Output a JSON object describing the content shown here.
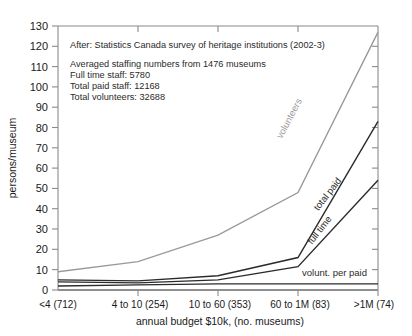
{
  "chart_data": {
    "type": "line",
    "title": "",
    "xlabel": "annual budget $10k, (no. museums)",
    "ylabel": "persons/museum",
    "categories": [
      "<4 (712)",
      "4 to 10 (254)",
      "10 to 60 (353)",
      "60 to 1M (83)",
      ">1M (74)"
    ],
    "ylim": [
      0,
      130
    ],
    "yticks": [
      0,
      10,
      20,
      30,
      40,
      50,
      60,
      70,
      80,
      90,
      100,
      110,
      120,
      130
    ],
    "grid": false,
    "legend": "inline-labels",
    "series": [
      {
        "name": "volunteers",
        "color": "#9a9a9a",
        "values": [
          9,
          14,
          27,
          48,
          127
        ]
      },
      {
        "name": "total paid",
        "color": "#2b2b2b",
        "values": [
          5,
          4.5,
          7,
          16,
          83
        ]
      },
      {
        "name": "full time",
        "color": "#2b2b2b",
        "values": [
          4,
          3.5,
          5,
          11.5,
          54
        ]
      },
      {
        "name": "volunt. per paid",
        "color": "#2b2b2b",
        "values": [
          2,
          2.5,
          3,
          3,
          3
        ]
      }
    ]
  },
  "annotations": {
    "source_line": "After: Statistics Canada survey of heritage institutions (2002-3)",
    "summary_lines": [
      "Averaged staffing numbers from 1476 museums",
      "Full time staff: 5780",
      "Total paid staff: 12168",
      "Total volunteers: 32688"
    ]
  },
  "axes": {
    "y_label": "persons/museum",
    "x_label": "annual budget $10k, (no. museums)",
    "y_tick_labels": [
      "0",
      "10",
      "20",
      "30",
      "40",
      "50",
      "60",
      "70",
      "80",
      "90",
      "100",
      "110",
      "120",
      "130"
    ],
    "x_tick_labels": [
      "<4 (712)",
      "4 to 10 (254)",
      "10 to 60 (353)",
      "60 to 1M (83)",
      ">1M (74)"
    ]
  },
  "series_labels": {
    "volunteers": "volunteers",
    "total_paid": "total paid",
    "full_time": "full time",
    "volunt_per_paid": "volunt. per paid"
  },
  "colors": {
    "volunteers": "#9a9a9a",
    "dark_line": "#2b2b2b",
    "axis": "#7d7d7d",
    "text": "#1a1a1a"
  }
}
